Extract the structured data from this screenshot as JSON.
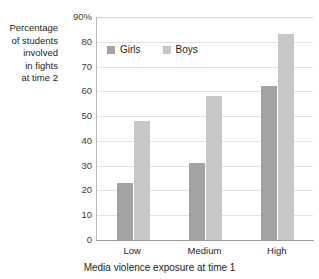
{
  "chart_data": {
    "type": "bar",
    "title": "",
    "subtitle": "",
    "categories": [
      "Low",
      "Medium",
      "High"
    ],
    "series": [
      {
        "name": "Girls",
        "values": [
          23,
          31,
          62
        ],
        "color": "#a3a3a3"
      },
      {
        "name": "Boys",
        "values": [
          48,
          58,
          83
        ],
        "color": "#c7c7c7"
      }
    ],
    "xlabel": "Media violence exposure at time 1",
    "ylabel": "Percentage\nof students\ninvolved\nin fights\nat time 2",
    "ylim": [
      0,
      90
    ],
    "ytick_values": [
      90,
      80,
      70,
      60,
      50,
      40,
      30,
      20,
      10,
      0
    ],
    "ytick_labels": [
      "90%",
      "80",
      "70",
      "60",
      "50",
      "40",
      "30",
      "20",
      "10",
      "0"
    ],
    "ytick_step": 10,
    "grid": "horizontal",
    "legend_position": "inside-top-left",
    "legend_entries": [
      "Girls",
      "Boys"
    ]
  },
  "colors": {
    "girls": "#a3a3a3",
    "boys": "#c7c7c7",
    "gridline": "#e3e3e3",
    "axis": "#9a9a9a",
    "text": "#231f20"
  }
}
